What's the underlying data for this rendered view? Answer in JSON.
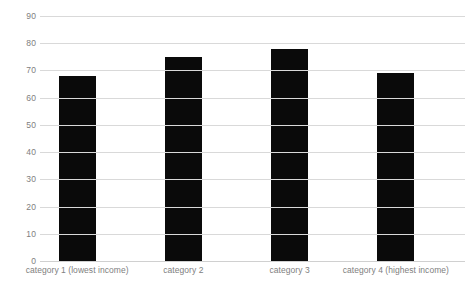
{
  "chart_data": {
    "type": "bar",
    "title": "",
    "subtitle": "",
    "xlabel": "",
    "ylabel": "",
    "categories": [
      "category 1 (lowest income)",
      "category 2",
      "category 3",
      "category 4 (highest income)"
    ],
    "values": [
      68,
      75,
      78,
      69
    ],
    "ylim": [
      0,
      90
    ],
    "ytick_step": 10,
    "yticks": [
      0,
      10,
      20,
      30,
      40,
      50,
      60,
      70,
      80,
      90
    ],
    "ytick_labels": [
      "0",
      "10",
      "20",
      "30",
      "40",
      "50",
      "60",
      "70",
      "80",
      "90"
    ],
    "grid": true,
    "grid_axis": "y",
    "legend": false,
    "legend_position": "none",
    "series": [
      {
        "name": "",
        "values": [
          68,
          75,
          78,
          69
        ]
      }
    ]
  },
  "style": {
    "bar_color": "#0a0a0a",
    "grid_color": "#d9d9d9",
    "tick_label_color": "#808080",
    "background_color": "#ffffff"
  }
}
